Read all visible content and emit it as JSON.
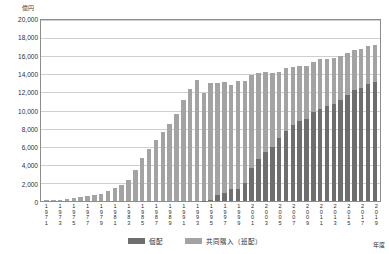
{
  "chart_data": {
    "type": "bar",
    "subtype": "stacked-bar",
    "title": "",
    "xlabel": "年度",
    "ylabel": "億円",
    "ylim": [
      0,
      20000
    ],
    "ytick_step": 2000,
    "ytick_labels": [
      "20,000",
      "18,000",
      "16,000",
      "14,000",
      "12,000",
      "10,000",
      "8,000",
      "6,000",
      "4,000",
      "2,000",
      "0"
    ],
    "grid": true,
    "legend_position": "bottom-center",
    "colors": {
      "kohai": "#6e6e6e",
      "kyodo": "#a3a3a3",
      "grid": "#cfcfcf",
      "frame": "#8d8d8d"
    },
    "categories": [
      "1971",
      "1972",
      "1973",
      "1974",
      "1975",
      "1976",
      "1977",
      "1978",
      "1979",
      "1980",
      "1981",
      "1982",
      "1983",
      "1984",
      "1985",
      "1986",
      "1987",
      "1988",
      "1989",
      "1990",
      "1991",
      "1992",
      "1993",
      "1994",
      "1995",
      "1996",
      "1997",
      "1998",
      "1999",
      "2000",
      "2001",
      "2002",
      "2003",
      "2004",
      "2005",
      "2006",
      "2007",
      "2008",
      "2009",
      "2010",
      "2011",
      "2012",
      "2013",
      "2014",
      "2015",
      "2016",
      "2017",
      "2018",
      "2019"
    ],
    "xtick_labels_shown": [
      "1971",
      "",
      "1973",
      "",
      "1975",
      "",
      "1977",
      "",
      "1979",
      "",
      "1981",
      "",
      "1983",
      "",
      "1985",
      "",
      "1987",
      "",
      "1989",
      "",
      "1991",
      "",
      "1993",
      "",
      "1995",
      "",
      "1997",
      "",
      "1999",
      "",
      "2001",
      "",
      "2003",
      "",
      "2005",
      "",
      "2007",
      "",
      "2009",
      "",
      "2011",
      "",
      "2013",
      "",
      "2015",
      "",
      "2017",
      "",
      "2019"
    ],
    "series": [
      {
        "name": "共同購入（班配）",
        "key": "kyodo",
        "color": "#a3a3a3",
        "values": [
          60,
          90,
          130,
          200,
          300,
          400,
          500,
          650,
          820,
          1050,
          1400,
          1800,
          2350,
          3350,
          4650,
          5700,
          6700,
          7550,
          8450,
          9500,
          11000,
          12250,
          13250,
          11750,
          12800,
          12250,
          12200,
          11350,
          11800,
          11150,
          10100,
          9350,
          8700,
          8050,
          7300,
          6950,
          6350,
          6050,
          5800,
          5500,
          5450,
          5200,
          5000,
          4800,
          4600,
          4400,
          4300,
          4150,
          4050
        ]
      },
      {
        "name": "個配",
        "key": "kohai",
        "color": "#6e6e6e",
        "values": [
          0,
          0,
          0,
          0,
          0,
          0,
          0,
          0,
          0,
          0,
          0,
          0,
          0,
          0,
          0,
          0,
          0,
          0,
          0,
          0,
          0,
          0,
          0,
          50,
          150,
          700,
          850,
          1300,
          1350,
          1950,
          3650,
          4600,
          5350,
          5900,
          6850,
          7600,
          8300,
          8700,
          9000,
          9700,
          10100,
          10350,
          10600,
          11050,
          11600,
          12100,
          12350,
          12750,
          13050
        ]
      }
    ],
    "totals": [
      60,
      90,
      130,
      200,
      300,
      400,
      500,
      650,
      820,
      1050,
      1400,
      1800,
      2350,
      3350,
      4650,
      5700,
      6700,
      7550,
      8450,
      9500,
      11000,
      12250,
      13250,
      11800,
      12950,
      12950,
      13050,
      12650,
      13150,
      13100,
      13750,
      13950,
      14050,
      13950,
      14150,
      14550,
      14650,
      14750,
      14800,
      15200,
      15550,
      15550,
      15600,
      15850,
      16200,
      16500,
      16650,
      16900,
      17100
    ]
  },
  "legend": {
    "items": [
      {
        "label": "個配",
        "color": "#6e6e6e"
      },
      {
        "label": "共同購入（班配）",
        "color": "#a3a3a3"
      }
    ]
  },
  "axes": {
    "y_unit": "億円",
    "x_title": "年度"
  }
}
